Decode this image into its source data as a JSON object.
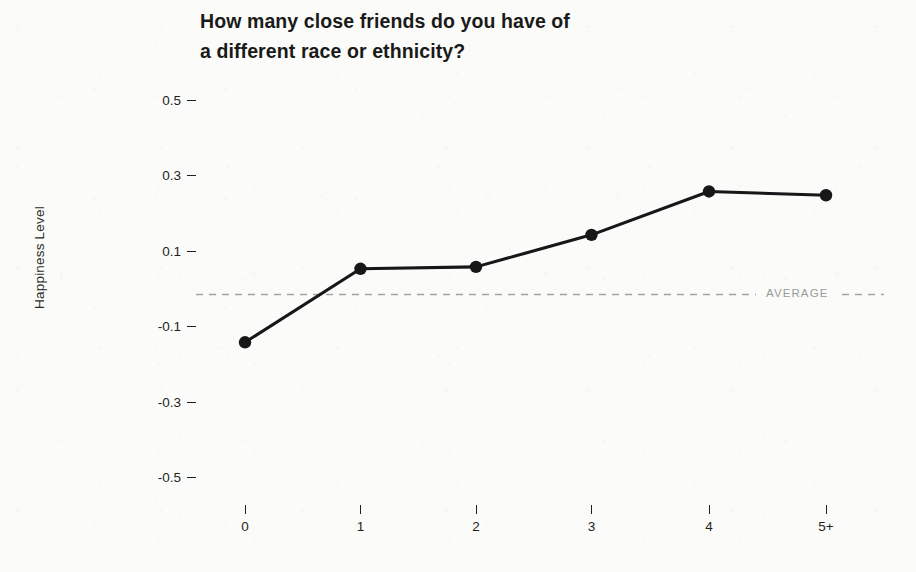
{
  "chart_data": {
    "type": "line",
    "title": "How many close friends do you have of\na different race or ethnicity?",
    "xlabel": "",
    "ylabel": "Happiness Level",
    "categories": [
      "0",
      "1",
      "2",
      "3",
      "4",
      "5+"
    ],
    "values": [
      -0.14,
      0.055,
      0.06,
      0.145,
      0.26,
      0.25
    ],
    "series": [
      {
        "name": "Happiness Level",
        "values": [
          -0.14,
          0.055,
          0.06,
          0.145,
          0.26,
          0.25
        ]
      }
    ],
    "ylim": [
      -0.6,
      0.6
    ],
    "yticks": [
      "0.5",
      "0.3",
      "0.1",
      "-0.1",
      "-0.3",
      "-0.5"
    ],
    "ytick_values": [
      0.5,
      0.3,
      0.1,
      -0.1,
      -0.3,
      -0.5
    ],
    "grid": false,
    "legend": "none",
    "annotations": [
      {
        "name": "average-reference-line",
        "label": "AVERAGE",
        "value": 0,
        "style": "dashed",
        "color": "#9a9a96"
      }
    ],
    "line_color": "#17171a",
    "marker": "circle",
    "marker_color": "#17171a",
    "background_color": "#fbfbfa"
  }
}
